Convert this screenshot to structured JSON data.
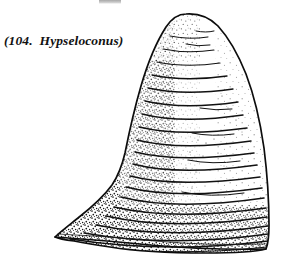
{
  "figure": {
    "caption": "(104.  Hypseloconus)",
    "figure_number": "104",
    "taxon_name": "Hypseloconus",
    "ink_color": "#111111",
    "background_color": "#ffffff",
    "stipple_color": "#1a1a1a",
    "outline": {
      "apex_point": [
        186,
        14
      ],
      "left_basal_tip": [
        55,
        237
      ],
      "right_basal_corner": [
        268,
        249
      ],
      "max_width_px": 213,
      "height_px": 243
    },
    "growth_lines": {
      "count": 20,
      "orientation": "horizontal, gently down-curving",
      "spacing_px": 11
    },
    "shading": {
      "left_flank": "dense black stipple",
      "right_margin": "light stipple band",
      "basal_rim": "heavy dark stipple"
    },
    "artifact": {
      "label": "cropped-mark-top",
      "color": "#8b8b8b"
    }
  }
}
